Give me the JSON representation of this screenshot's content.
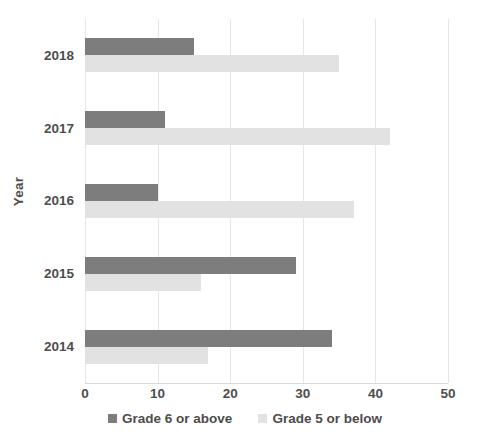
{
  "chart_data": {
    "type": "bar",
    "orientation": "horizontal",
    "title": "",
    "xlabel": "",
    "ylabel": "Year",
    "categories": [
      "2018",
      "2017",
      "2016",
      "2015",
      "2014"
    ],
    "series": [
      {
        "name": "Grade 6 or above",
        "color": "#7d7d7d",
        "values": [
          15,
          11,
          10,
          29,
          34
        ]
      },
      {
        "name": "Grade 5 or below",
        "color": "#e2e2e2",
        "values": [
          35,
          42,
          37,
          16,
          17
        ]
      }
    ],
    "xlim": [
      0,
      50
    ],
    "xticks": [
      0,
      10,
      20,
      30,
      40,
      50
    ],
    "xtick_labels": [
      "0",
      "10",
      "20",
      "30",
      "40",
      "50"
    ],
    "grid": "vertical",
    "legend_position": "bottom"
  },
  "axis": {
    "y_title": "Year"
  },
  "legend": {
    "items": [
      {
        "label": "Grade 6 or above",
        "swatch": "primary"
      },
      {
        "label": "Grade 5 or below",
        "swatch": "secondary"
      }
    ]
  },
  "colors": {
    "series_primary": "#7d7d7d",
    "series_secondary": "#e2e2e2",
    "gridline": "#e6e6e6",
    "text": "#4d4d4d",
    "background": "#ffffff"
  }
}
